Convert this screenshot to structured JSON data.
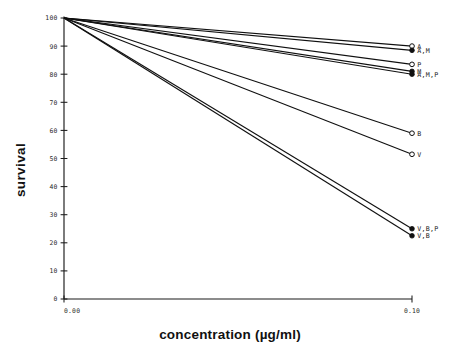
{
  "chart_data": {
    "type": "line",
    "title": "",
    "xlabel": "concentration (µg/ml)",
    "ylabel": "survival",
    "xlim": [
      0.0,
      0.1
    ],
    "ylim": [
      0,
      100
    ],
    "x": [
      0.0,
      0.1
    ],
    "grid": false,
    "legend_position": "right-endpoint-labels",
    "xticks": [
      {
        "value": 0.0,
        "label": "0.00"
      },
      {
        "value": 0.1,
        "label": "0.10"
      }
    ],
    "yticks": [
      {
        "value": 0,
        "label": "0"
      },
      {
        "value": 10,
        "label": "10"
      },
      {
        "value": 20,
        "label": "20"
      },
      {
        "value": 30,
        "label": "30"
      },
      {
        "value": 40,
        "label": "40"
      },
      {
        "value": 50,
        "label": "50"
      },
      {
        "value": 60,
        "label": "60"
      },
      {
        "value": 70,
        "label": "70"
      },
      {
        "value": 80,
        "label": "80"
      },
      {
        "value": 90,
        "label": "90"
      },
      {
        "value": 100,
        "label": "100"
      }
    ],
    "series": [
      {
        "name": "A",
        "label": "A",
        "values": [
          100,
          90.0
        ],
        "marker": "open"
      },
      {
        "name": "A,M",
        "label": "A,M",
        "values": [
          100,
          88.5
        ],
        "marker": "filled"
      },
      {
        "name": "P",
        "label": "P",
        "values": [
          100,
          83.5
        ],
        "marker": "open"
      },
      {
        "name": "M",
        "label": "M",
        "values": [
          100,
          81.0
        ],
        "marker": "filled"
      },
      {
        "name": "A,M,P",
        "label": "A,M,P",
        "values": [
          100,
          80.0
        ],
        "marker": "filled"
      },
      {
        "name": "B",
        "label": "B",
        "values": [
          100,
          59.0
        ],
        "marker": "open"
      },
      {
        "name": "V",
        "label": "V",
        "values": [
          100,
          51.5
        ],
        "marker": "open"
      },
      {
        "name": "V,B,P",
        "label": "V,B,P",
        "values": [
          100,
          25.0
        ],
        "marker": "filled"
      },
      {
        "name": "V,B",
        "label": "V,B",
        "values": [
          100,
          22.5
        ],
        "marker": "filled"
      }
    ]
  },
  "colors": {
    "ink": "#101010",
    "background": "#ffffff"
  }
}
